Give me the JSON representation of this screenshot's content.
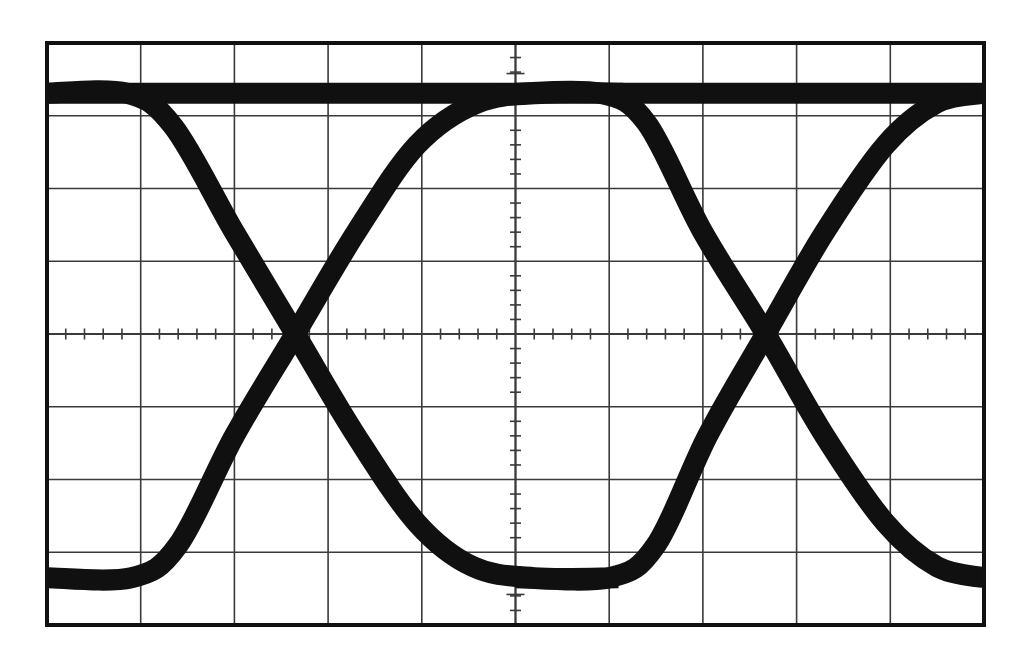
{
  "document": {
    "kind": "oscilloscope-eye-diagram-photograph",
    "background_color": "#ffffff",
    "trace_color": "#101010",
    "graticule_color": "#3a3a3a",
    "border_color": "#111111"
  },
  "graticule": {
    "label": "oscilloscope-graticule",
    "left_px": 47,
    "top_px": 43,
    "right_px": 984,
    "bottom_px": 625,
    "horizontal_divisions": 10,
    "vertical_divisions": 8,
    "division_width_px": 93.7,
    "division_height_px": 72.75,
    "border_width_px": 4,
    "gridline_width_px": 1.6,
    "center_x_px": 515.5,
    "center_y_px": 334,
    "minor_ticks_per_division": 5,
    "minor_tick_length_px": 11,
    "center_axis_tick_length_px": 9
  },
  "chart_data": {
    "type": "line",
    "xlabel": "Time (divisions)",
    "ylabel": "Amplitude (divisions)",
    "xlim": [
      0,
      10
    ],
    "ylim": [
      0,
      8
    ],
    "grid": true,
    "legend": "none",
    "trace_thickness_px": 21,
    "logic_high_div_y": 0.69,
    "logic_low_div_y": 7.35,
    "crossing_points_div": [
      {
        "x": 2.65,
        "y": 4.0
      },
      {
        "x": 7.67,
        "y": 4.0
      }
    ],
    "eye_opening_div": {
      "width": 5.02,
      "height": 6.66
    },
    "series": [
      {
        "name": "high-level-rail",
        "points_div": [
          [
            0.0,
            0.69
          ],
          [
            10.0,
            0.69
          ]
        ]
      },
      {
        "name": "falling-edge-1",
        "points_div": [
          [
            0.0,
            0.69
          ],
          [
            0.85,
            0.69
          ],
          [
            1.35,
            1.15
          ],
          [
            2.0,
            2.6
          ],
          [
            2.65,
            4.0
          ],
          [
            3.3,
            5.4
          ],
          [
            3.95,
            6.6
          ],
          [
            4.55,
            7.2
          ],
          [
            5.2,
            7.35
          ],
          [
            6.1,
            7.35
          ]
        ]
      },
      {
        "name": "rising-edge-1",
        "points_div": [
          [
            0.0,
            7.35
          ],
          [
            0.9,
            7.35
          ],
          [
            1.4,
            6.9
          ],
          [
            2.0,
            5.4
          ],
          [
            2.65,
            4.0
          ],
          [
            3.3,
            2.6
          ],
          [
            3.95,
            1.4
          ],
          [
            4.6,
            0.82
          ],
          [
            5.3,
            0.69
          ],
          [
            6.15,
            0.69
          ]
        ]
      },
      {
        "name": "falling-edge-2",
        "points_div": [
          [
            5.0,
            0.69
          ],
          [
            5.9,
            0.69
          ],
          [
            6.4,
            1.1
          ],
          [
            7.0,
            2.6
          ],
          [
            7.67,
            4.0
          ],
          [
            8.3,
            5.4
          ],
          [
            8.95,
            6.6
          ],
          [
            9.5,
            7.2
          ],
          [
            10.0,
            7.35
          ]
        ]
      },
      {
        "name": "rising-edge-2",
        "points_div": [
          [
            5.0,
            7.35
          ],
          [
            6.0,
            7.35
          ],
          [
            6.5,
            6.9
          ],
          [
            7.05,
            5.4
          ],
          [
            7.67,
            4.0
          ],
          [
            8.3,
            2.6
          ],
          [
            8.95,
            1.4
          ],
          [
            9.5,
            0.82
          ],
          [
            10.0,
            0.69
          ]
        ]
      }
    ]
  }
}
